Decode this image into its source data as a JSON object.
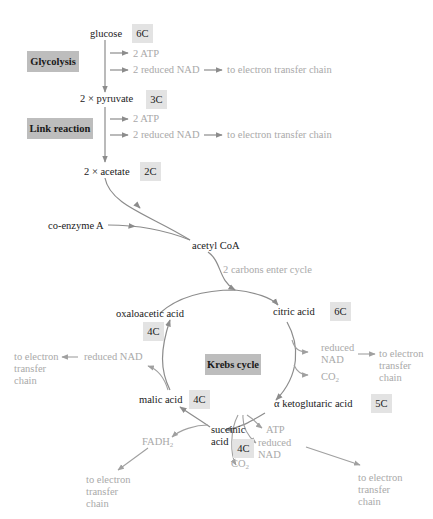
{
  "colors": {
    "text_dark": "#1a1a1a",
    "text_grey": "#a9a9a9",
    "arrow": "#8c8c8c",
    "stage_box": "#bdbdbd",
    "carbon_box": "#e3e3e3",
    "background": "#ffffff"
  },
  "stages": {
    "glycolysis": "Glycolysis",
    "link_reaction": "Link reaction",
    "krebs_cycle": "Krebs cycle"
  },
  "molecules": {
    "glucose": {
      "name": "glucose",
      "carbons": "6C"
    },
    "pyruvate": {
      "name": "2 × pyruvate",
      "carbons": "3C"
    },
    "acetate": {
      "name": "2 × acetate",
      "carbons": "2C"
    },
    "coenzyme_a": {
      "name": "co-enzyme A"
    },
    "acetyl_coa": {
      "name": "acetyl CoA"
    },
    "citric_acid": {
      "name": "citric acid",
      "carbons": "6C"
    },
    "ketoglutaric_acid": {
      "name": "α ketoglutaric acid",
      "carbons": "5C"
    },
    "succinic_acid": {
      "name": "succinic\nacid",
      "carbons": "4C"
    },
    "malic_acid": {
      "name": "malic acid",
      "carbons": "4C"
    },
    "oxaloacetic_acid": {
      "name": "oxaloacetic acid",
      "carbons": "4C"
    }
  },
  "products": {
    "glycolysis_atp": "2 ATP",
    "glycolysis_nad": "2 reduced NAD",
    "glycolysis_etc": "to electron transfer chain",
    "link_atp": "2 ATP",
    "link_nad": "2 reduced NAD",
    "link_etc": "to electron transfer chain",
    "carbons_enter": "2 carbons enter cycle",
    "citric_nad": "reduced\nNAD",
    "citric_co2": "CO",
    "citric_etc": "to electron\ntransfer\nchain",
    "keto_atp": "ATP",
    "keto_nad": "reduced\nNAD",
    "keto_co2": "CO",
    "keto_etc": "to electron\ntransfer\nchain",
    "succinic_fadh": "FADH",
    "succinic_etc": "to electron\ntransfer\nchain",
    "malic_nad": "reduced NAD",
    "malic_etc": "to electron\ntransfer\nchain",
    "subscript_2": "2"
  }
}
